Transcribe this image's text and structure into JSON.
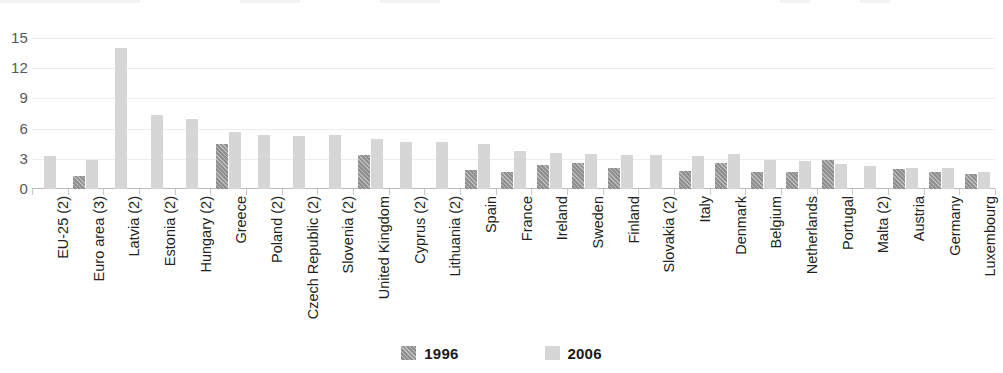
{
  "chart_data": {
    "type": "bar",
    "title": "",
    "xlabel": "",
    "ylabel": "",
    "ylim": [
      0,
      16
    ],
    "yticks": [
      0,
      3,
      6,
      9,
      12,
      15
    ],
    "grid": true,
    "legend_position": "bottom-center",
    "categories": [
      "EU-25 (2)",
      "Euro area (3)",
      "Latvia (2)",
      "Estonia (2)",
      "Hungary (2)",
      "Greece",
      "Poland (2)",
      "Czech Republic (2)",
      "Slovenia (2)",
      "United Kingdom",
      "Cyprus (2)",
      "Lithuania (2)",
      "Spain",
      "France",
      "Ireland",
      "Sweden",
      "Finland",
      "Slovakia (2)",
      "Italy",
      "Denmark",
      "Belgium",
      "Netherlands",
      "Portugal",
      "Malta (2)",
      "Austria",
      "Germany",
      "Luxembourg"
    ],
    "series": [
      {
        "name": "1996",
        "color": "#8f8f90",
        "values": [
          null,
          1.3,
          null,
          null,
          null,
          4.5,
          null,
          null,
          null,
          3.4,
          null,
          null,
          1.9,
          1.7,
          2.4,
          2.6,
          2.1,
          null,
          1.8,
          2.6,
          1.7,
          1.7,
          2.9,
          null,
          2.0,
          1.7,
          1.5
        ]
      },
      {
        "name": "2006",
        "color": "#d6d6d6",
        "values": [
          3.3,
          2.9,
          14.0,
          7.4,
          7.0,
          5.7,
          5.4,
          5.3,
          5.4,
          5.0,
          4.7,
          4.7,
          4.5,
          3.8,
          3.6,
          3.5,
          3.4,
          3.4,
          3.3,
          3.5,
          2.9,
          2.8,
          2.5,
          2.3,
          2.1,
          2.1,
          1.7
        ]
      }
    ]
  },
  "legend": {
    "items": [
      {
        "label": "1996",
        "swatch": "hatched-gray-swatch"
      },
      {
        "label": "2006",
        "swatch": "light-gray-swatch"
      }
    ]
  }
}
